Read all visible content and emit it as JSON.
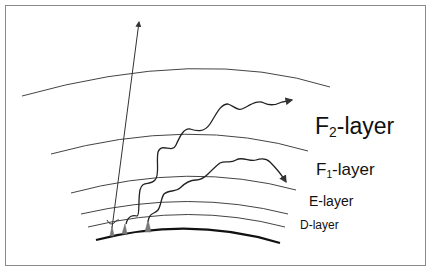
{
  "diagram": {
    "colors": {
      "line": "#333333",
      "ground": "#111111",
      "antenna": "#777777",
      "frame": "#8a8a8a",
      "background": "#ffffff"
    },
    "layers": [
      {
        "id": "F2",
        "prefix": "F",
        "subscript": "2",
        "suffix": "-layer"
      },
      {
        "id": "F1",
        "prefix": "F",
        "subscript": "1",
        "suffix": "-layer"
      },
      {
        "id": "E",
        "label": "E-layer"
      },
      {
        "id": "D",
        "label": "D-layer"
      }
    ],
    "elements": {
      "ground": "Earth surface",
      "antennas": [
        "antenna-1",
        "antenna-2",
        "antenna-3"
      ],
      "rays": [
        "straight ray escaping to space",
        "wavy ray reflected from F2-layer",
        "wavy ray reflected from F1-layer",
        "small ray absorbed in D-layer"
      ]
    }
  }
}
